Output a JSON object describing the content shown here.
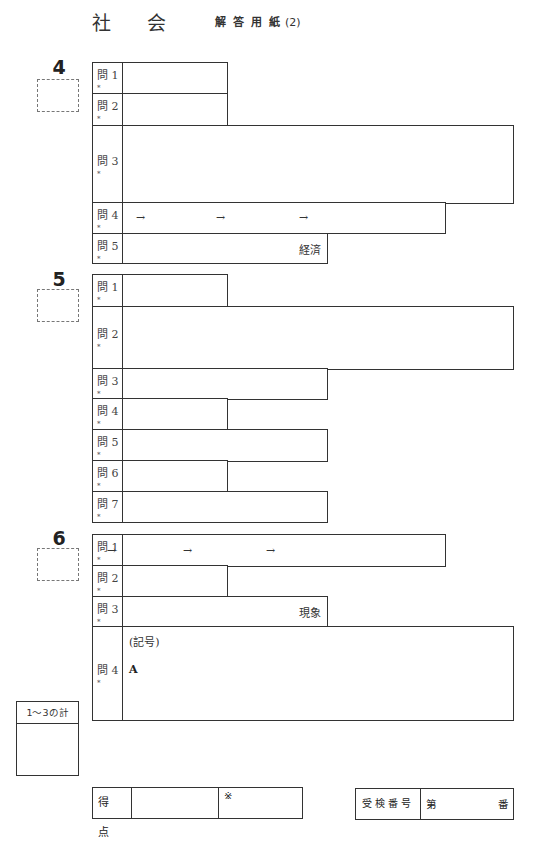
{
  "header": {
    "subject_char1": "社",
    "subject_char2": "会",
    "sheet_title": "解答用紙",
    "sheet_number": "(2)"
  },
  "sections": [
    {
      "number": "4",
      "number_top": 56,
      "box_top": 79,
      "rows": [
        {
          "label": "問 1",
          "mark": "*",
          "top": 62,
          "height": 31,
          "width": 136
        },
        {
          "label": "問 2",
          "mark": "*",
          "top": 93,
          "height": 32,
          "width": 136
        },
        {
          "label": "問 3",
          "mark": "*",
          "top": 125,
          "height": 78,
          "width": 422,
          "label_mid": true
        },
        {
          "label": "問 4",
          "mark": "*",
          "top": 202,
          "height": 31,
          "width": 354,
          "arrows": [
            "→",
            "→",
            "→"
          ]
        },
        {
          "label": "問 5",
          "mark": "*",
          "top": 233,
          "height": 30,
          "width": 236,
          "suffix": "経済"
        }
      ]
    },
    {
      "number": "5",
      "number_top": 268,
      "box_top": 289,
      "rows": [
        {
          "label": "問 1",
          "mark": "*",
          "top": 274,
          "height": 32,
          "width": 136
        },
        {
          "label": "問 2",
          "mark": "*",
          "top": 306,
          "height": 63,
          "width": 422,
          "label_mid": true
        },
        {
          "label": "問 3",
          "mark": "*",
          "top": 368,
          "height": 31,
          "width": 236
        },
        {
          "label": "問 4",
          "mark": "*",
          "top": 398,
          "height": 31,
          "width": 136
        },
        {
          "label": "問 5",
          "mark": "*",
          "top": 429,
          "height": 32,
          "width": 236
        },
        {
          "label": "問 6",
          "mark": "*",
          "top": 460,
          "height": 31,
          "width": 136
        },
        {
          "label": "問 7",
          "mark": "*",
          "top": 491,
          "height": 31,
          "width": 236
        }
      ]
    },
    {
      "number": "6",
      "number_top": 527,
      "box_top": 548,
      "rows": [
        {
          "label": "問 1",
          "mark": "*",
          "top": 534,
          "height": 32,
          "width": 354,
          "arrows": [
            "→",
            "→",
            "→"
          ],
          "arrow_positions": [
            106,
            182,
            265
          ]
        },
        {
          "label": "問 2",
          "mark": "*",
          "top": 565,
          "height": 31,
          "width": 136
        },
        {
          "label": "問 3",
          "mark": "*",
          "top": 596,
          "height": 31,
          "width": 236,
          "suffix": "現象"
        },
        {
          "label": "問 4",
          "mark": "*",
          "top": 626,
          "height": 94,
          "width": 422,
          "label_mid": true,
          "kigou": "(記号)",
          "letter": "A"
        }
      ]
    }
  ],
  "arrow_positions_default": [
    135,
    215,
    298
  ],
  "subtotal": {
    "label": "1～3の計"
  },
  "score": {
    "label": "得 点",
    "note_mark": "※"
  },
  "exam_number": {
    "label": "受検番号",
    "prefix": "第",
    "suffix": "番"
  }
}
